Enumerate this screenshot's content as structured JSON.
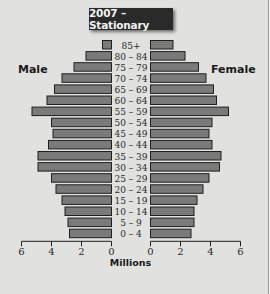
{
  "chart_data": {
    "type": "bar",
    "subtype": "population-pyramid",
    "title": "2007 – Stationary",
    "xlabel": "Millions",
    "ylabel": "",
    "left_series_label": "Male",
    "right_series_label": "Female",
    "categories": [
      "85+",
      "80 – 84",
      "75 – 79",
      "70 – 74",
      "65 – 69",
      "60 – 64",
      "55 – 59",
      "50 – 54",
      "45 – 49",
      "40 – 44",
      "35 – 39",
      "30 – 34",
      "25 – 29",
      "20 – 24",
      "15 – 19",
      "10 – 14",
      "5 – 9",
      "0 – 4"
    ],
    "series": [
      {
        "name": "Male",
        "values": [
          0.6,
          1.7,
          2.5,
          3.3,
          3.8,
          4.3,
          5.3,
          4.0,
          3.9,
          4.2,
          4.9,
          4.9,
          4.0,
          3.7,
          3.3,
          3.1,
          2.9,
          2.8
        ]
      },
      {
        "name": "Female",
        "values": [
          1.5,
          2.3,
          3.2,
          3.7,
          4.2,
          4.4,
          5.2,
          4.1,
          3.9,
          4.1,
          4.7,
          4.6,
          3.9,
          3.5,
          3.1,
          2.9,
          2.9,
          2.7
        ]
      }
    ],
    "xlim": [
      0,
      6
    ],
    "left_ticks": [
      "6",
      "4",
      "2",
      "0"
    ],
    "right_ticks": [
      "0",
      "2",
      "4",
      "6"
    ],
    "tick_values": [
      0,
      2,
      4,
      6
    ],
    "grid": false,
    "legend": "side labels (left: Male, right: Female)"
  }
}
